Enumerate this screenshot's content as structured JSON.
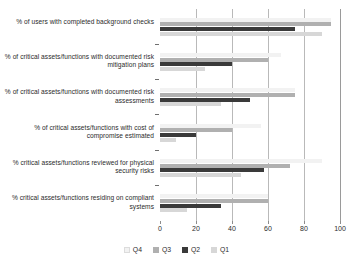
{
  "chart_data": {
    "type": "bar",
    "orientation": "horizontal",
    "title": "",
    "subtitle": "",
    "xlabel": "",
    "ylabel": "",
    "xlim": [
      0,
      100
    ],
    "xticks": [
      0,
      20,
      40,
      60,
      80,
      100
    ],
    "grid": true,
    "grid_axis": "x",
    "legend_position": "bottom",
    "series_draw_order_top_to_bottom": [
      "Q4",
      "Q3",
      "Q2",
      "Q1"
    ],
    "categories": [
      "% of users with completed background checks",
      "% of critical assets/functions with documented risk mitigation plans",
      "% of critical assets/functions with documented risk assessments",
      "% of critical assets/functions with cost of compromise estimated",
      "% critical assets/functions reviewed for physical security risks",
      "% critical assets/functions residing on compliant systems"
    ],
    "series": [
      {
        "name": "Q4",
        "color": "#f2f2f2",
        "values": [
          95,
          67,
          75,
          56,
          90,
          60
        ]
      },
      {
        "name": "Q3",
        "color": "#b0b0b0",
        "values": [
          95,
          60,
          75,
          40,
          72,
          60
        ]
      },
      {
        "name": "Q2",
        "color": "#3a3a3a",
        "values": [
          75,
          40,
          50,
          20,
          58,
          34
        ]
      },
      {
        "name": "Q1",
        "color": "#d7d7d7",
        "values": [
          90,
          25,
          34,
          9,
          45,
          15
        ]
      }
    ]
  },
  "legend": {
    "items": [
      {
        "label": "Q4",
        "key": "q4"
      },
      {
        "label": "Q3",
        "key": "q3"
      },
      {
        "label": "Q2",
        "key": "q2"
      },
      {
        "label": "Q1",
        "key": "q1"
      }
    ]
  },
  "axis": {
    "tick_labels": [
      "0",
      "20",
      "40",
      "60",
      "80",
      "100"
    ]
  }
}
